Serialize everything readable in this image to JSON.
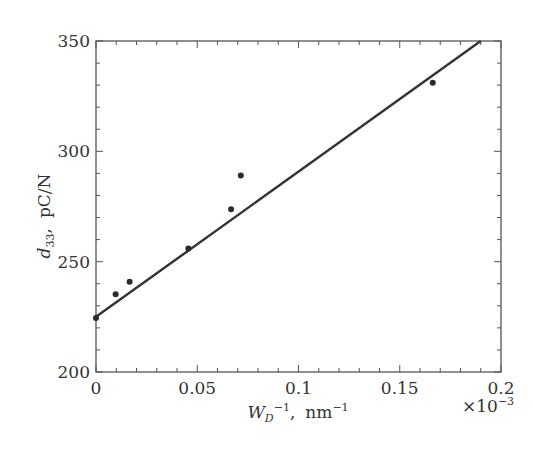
{
  "chart_data": {
    "type": "scatter",
    "title": "",
    "xlabel": "W_D^-1, nm^-1",
    "xlabel_parts": {
      "main": "W",
      "sub": "D",
      "sup": "−1",
      "sep": ",",
      "unit": "nm",
      "unit_sup": "−1"
    },
    "x_multiplier": "×10⁻³",
    "x_multiplier_parts": {
      "base": "×10",
      "exp": "−3"
    },
    "ylabel": "d33, pC/N",
    "ylabel_parts": {
      "main": "d",
      "sub": "33",
      "sep": ",",
      "unit": "pC/N"
    },
    "xlim": [
      0,
      0.2
    ],
    "ylim": [
      200,
      350
    ],
    "x_ticks": [
      0,
      0.05,
      0.1,
      0.15,
      0.2
    ],
    "x_tick_labels": [
      "0",
      "0.05",
      "0.1",
      "0.15",
      "0.2"
    ],
    "y_ticks": [
      200,
      250,
      300,
      350
    ],
    "y_tick_labels": [
      "200",
      "250",
      "300",
      "350"
    ],
    "x_minor_step": 0.01,
    "y_minor_step": 10,
    "grid": false,
    "legend": null,
    "series": [
      {
        "name": "measured",
        "type": "scatter",
        "x": [
          0,
          0.0097,
          0.0166,
          0.0456,
          0.0667,
          0.0715,
          0.1663
        ],
        "y": [
          224.5,
          235.2,
          240.9,
          256.0,
          273.7,
          289.1,
          331.1
        ]
      },
      {
        "name": "linear fit",
        "type": "line",
        "x": [
          0,
          0.19
        ],
        "y": [
          225,
          350
        ]
      }
    ],
    "colors": {
      "line": "#333333",
      "marker": "#2a2a2a",
      "axis": "#555555"
    }
  }
}
